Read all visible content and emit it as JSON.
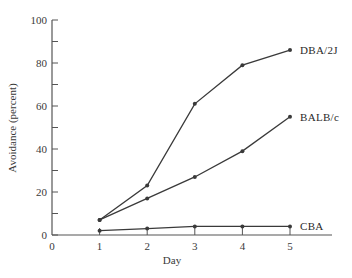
{
  "chart_data": {
    "type": "line",
    "title": "",
    "xlabel": "Day",
    "ylabel": "Avoidance (percent)",
    "x": [
      1,
      2,
      3,
      4,
      5
    ],
    "x_ticks": [
      "0",
      "1",
      "2",
      "3",
      "4",
      "5"
    ],
    "y_ticks": [
      "0",
      "20",
      "40",
      "60",
      "80",
      "100"
    ],
    "xlim": [
      0,
      5
    ],
    "ylim": [
      0,
      100
    ],
    "grid": false,
    "legend_position": "inline-right",
    "series": [
      {
        "name": "DBA/2J",
        "values": [
          7,
          23,
          61,
          79,
          86
        ]
      },
      {
        "name": "BALB/c",
        "values": [
          7,
          17,
          27,
          39,
          55
        ]
      },
      {
        "name": "CBA",
        "values": [
          2,
          3,
          4,
          4,
          4
        ]
      }
    ]
  },
  "colors": {
    "line": "#3a3a3a",
    "axis": "#555555",
    "background": "#ffffff"
  }
}
